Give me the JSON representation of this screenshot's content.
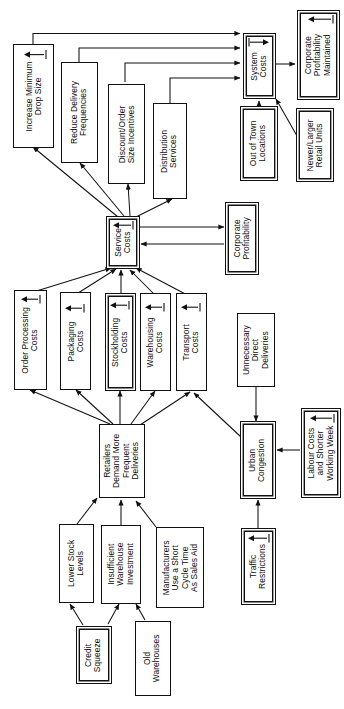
{
  "diagram": {
    "type": "cause-and-effect flow diagram",
    "orientation": "text rotated 90 degrees counter-clockwise (read bottom-to-top)",
    "line_color": "#111111",
    "box_fill": "#ffffff",
    "nodes": [
      {
        "id": "increase_min_drop",
        "label": "Increase Minimum\nDrop Size",
        "glyph": "tick-arrow-icon",
        "style": "single"
      },
      {
        "id": "reduce_delivery",
        "label": "Reduce Delivery\nFrequencies",
        "glyph": "none",
        "style": "single"
      },
      {
        "id": "discount_order",
        "label": "Discount/Order\nSize Incentives",
        "glyph": "none",
        "style": "single"
      },
      {
        "id": "distribution_svc",
        "label": "Distribution\nServices",
        "glyph": "none",
        "style": "single"
      },
      {
        "id": "system_costs",
        "label": "System\nCosts",
        "glyph": "tick-arrow-icon",
        "style": "double"
      },
      {
        "id": "corp_prof_maint",
        "label": "Corporate\nProfitability\nMaintained",
        "glyph": "tick-arrow-icon",
        "style": "double"
      },
      {
        "id": "out_of_town",
        "label": "Out of Town\nLocations",
        "glyph": "none",
        "style": "double"
      },
      {
        "id": "newer_larger",
        "label": "Newer/Larger\nRetail Units",
        "glyph": "none",
        "style": "double"
      },
      {
        "id": "service_costs",
        "label": "Service\nCosts",
        "glyph": "tick-arrow-icon",
        "style": "double"
      },
      {
        "id": "corp_prof",
        "label": "Corporate\nProfitability",
        "glyph": "none",
        "style": "double"
      },
      {
        "id": "order_processing",
        "label": "Order Processing\nCosts",
        "glyph": "tick-arrow-icon",
        "style": "single"
      },
      {
        "id": "packaging_costs",
        "label": "Packaging\nCosts",
        "glyph": "tick-arrow-icon",
        "style": "single"
      },
      {
        "id": "stockholding_costs",
        "label": "Stockholding\nCosts",
        "glyph": "tick-arrow-icon",
        "style": "double"
      },
      {
        "id": "warehousing_costs",
        "label": "Warehousing\nCosts",
        "glyph": "tick-arrow-icon",
        "style": "single"
      },
      {
        "id": "transport_costs",
        "label": "Transport\nCosts",
        "glyph": "tick-arrow-icon",
        "style": "single"
      },
      {
        "id": "unnecessary_direct",
        "label": "Unnecessary\nDirect\nDeliveries",
        "glyph": "none",
        "style": "single"
      },
      {
        "id": "retailers_demand",
        "label": "Retailers\nDemand More\nFrequent\nDeliveries",
        "glyph": "none",
        "style": "single"
      },
      {
        "id": "urban_congestion",
        "label": "Urban\nCongestion",
        "glyph": "none",
        "style": "double"
      },
      {
        "id": "labour_costs",
        "label": "Labour Costs\nand Shorter\nWorking Week",
        "glyph": "tick-arrow-icon",
        "style": "double"
      },
      {
        "id": "lower_stock",
        "label": "Lower Stock\nLevels",
        "glyph": "none",
        "style": "single"
      },
      {
        "id": "insufficient_wh",
        "label": "Insufficient\nWarehouse\nInvestment",
        "glyph": "none",
        "style": "single"
      },
      {
        "id": "manufacturers",
        "label": "Manufacturers\nUse a Short\nCycle Time\nAs Sales Aid",
        "glyph": "none",
        "style": "single"
      },
      {
        "id": "traffic_restrictions",
        "label": "Traffic\nRestrictions",
        "glyph": "tick-arrow-icon",
        "style": "double"
      },
      {
        "id": "credit_squeeze",
        "label": "Credit\nSqueeze",
        "glyph": "none",
        "style": "double"
      },
      {
        "id": "old_warehouses",
        "label": "Old\nWarehouses",
        "glyph": "none",
        "style": "single"
      }
    ],
    "edges": [
      {
        "from": "increase_min_drop",
        "to": "system_costs"
      },
      {
        "from": "reduce_delivery",
        "to": "system_costs"
      },
      {
        "from": "discount_order",
        "to": "system_costs"
      },
      {
        "from": "distribution_svc",
        "to": "system_costs"
      },
      {
        "from": "system_costs",
        "to": "corp_prof_maint"
      },
      {
        "from": "out_of_town",
        "to": "system_costs"
      },
      {
        "from": "newer_larger",
        "to": "system_costs"
      },
      {
        "from": "service_costs",
        "to": "increase_min_drop"
      },
      {
        "from": "service_costs",
        "to": "reduce_delivery"
      },
      {
        "from": "service_costs",
        "to": "discount_order"
      },
      {
        "from": "service_costs",
        "to": "distribution_svc"
      },
      {
        "from": "service_costs",
        "to": "corp_prof"
      },
      {
        "from": "corp_prof",
        "to": "service_costs"
      },
      {
        "from": "order_processing",
        "to": "service_costs"
      },
      {
        "from": "packaging_costs",
        "to": "service_costs"
      },
      {
        "from": "stockholding_costs",
        "to": "service_costs"
      },
      {
        "from": "warehousing_costs",
        "to": "service_costs"
      },
      {
        "from": "transport_costs",
        "to": "service_costs"
      },
      {
        "from": "retailers_demand",
        "to": "order_processing"
      },
      {
        "from": "retailers_demand",
        "to": "packaging_costs"
      },
      {
        "from": "retailers_demand",
        "to": "stockholding_costs"
      },
      {
        "from": "retailers_demand",
        "to": "warehousing_costs"
      },
      {
        "from": "retailers_demand",
        "to": "transport_costs"
      },
      {
        "from": "unnecessary_direct",
        "to": "urban_congestion"
      },
      {
        "from": "urban_congestion",
        "to": "transport_costs"
      },
      {
        "from": "labour_costs",
        "to": "urban_congestion"
      },
      {
        "from": "traffic_restrictions",
        "to": "urban_congestion"
      },
      {
        "from": "lower_stock",
        "to": "retailers_demand"
      },
      {
        "from": "insufficient_wh",
        "to": "retailers_demand"
      },
      {
        "from": "manufacturers",
        "to": "retailers_demand"
      },
      {
        "from": "credit_squeeze",
        "to": "lower_stock"
      },
      {
        "from": "credit_squeeze",
        "to": "insufficient_wh"
      },
      {
        "from": "old_warehouses",
        "to": "insufficient_wh"
      }
    ]
  }
}
